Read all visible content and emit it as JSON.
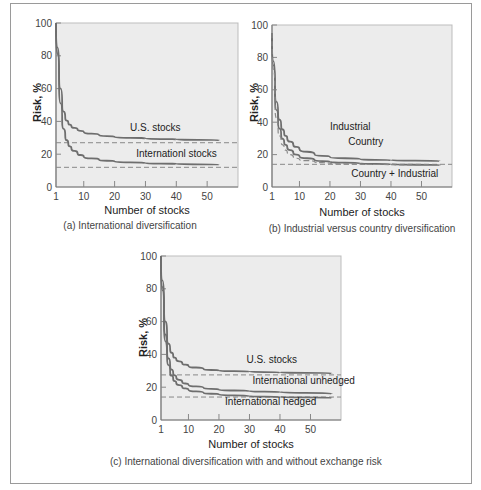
{
  "chart_data": [
    {
      "id": "a",
      "type": "line",
      "title": "(a) International diversification",
      "xlabel": "Number of stocks",
      "ylabel": "Risk, %",
      "xticks": [
        1,
        10,
        20,
        30,
        40,
        50
      ],
      "yticks": [
        0,
        20,
        40,
        60,
        80,
        100
      ],
      "xlim": [
        1,
        60
      ],
      "ylim": [
        0,
        100
      ],
      "series": [
        {
          "name": "U.S. stocks",
          "x": [
            1,
            2,
            3,
            4,
            5,
            6,
            8,
            10,
            15,
            20,
            30,
            40,
            54
          ],
          "y": [
            100,
            70,
            50,
            42,
            39,
            37,
            35,
            33.5,
            31.5,
            30.5,
            29.5,
            29,
            28.5
          ]
        },
        {
          "name": "Internationl stocks",
          "x": [
            1,
            2,
            3,
            4,
            5,
            6,
            8,
            10,
            15,
            20,
            30,
            40,
            54
          ],
          "y": [
            100,
            62,
            40,
            31,
            26,
            23.5,
            20.5,
            18.5,
            16.5,
            15.5,
            14.5,
            14,
            13.7
          ]
        }
      ],
      "reference_lines": [
        {
          "label": "U.S. stocks asymptote",
          "y": 27,
          "style": "dashed"
        },
        {
          "label": "International stocks asymptote",
          "y": 12,
          "style": "dashed"
        }
      ],
      "annotations": [
        {
          "text": "U.S. stocks",
          "x": 25,
          "y": 34
        },
        {
          "text": "Internationl stocks",
          "x": 27,
          "y": 18
        }
      ]
    },
    {
      "id": "b",
      "type": "line",
      "title": "(b) Industrial versus country diversification",
      "xlabel": "Number of stocks",
      "ylabel": "Risk, %",
      "xticks": [
        1,
        10,
        20,
        30,
        40,
        50
      ],
      "yticks": [
        0,
        20,
        40,
        60,
        80,
        100
      ],
      "xlim": [
        1,
        60
      ],
      "ylim": [
        0,
        100
      ],
      "series": [
        {
          "name": "Industrial",
          "x": [
            1,
            2,
            3,
            4,
            5,
            6,
            8,
            10,
            15,
            20,
            30,
            40,
            56
          ],
          "y": [
            95,
            60,
            45,
            38,
            33,
            30,
            26,
            23.5,
            20,
            18.5,
            17,
            16.5,
            16
          ]
        },
        {
          "name": "Country",
          "x": [
            1,
            2,
            3,
            4,
            5,
            6,
            8,
            10,
            15,
            20,
            30,
            40,
            56
          ],
          "y": [
            95,
            55,
            40,
            32,
            27.5,
            24.5,
            21,
            19,
            16.5,
            15.5,
            14.5,
            14,
            13.5
          ]
        },
        {
          "name": "Country + Industrial",
          "x": [
            1,
            2,
            3,
            4,
            5,
            6,
            8,
            10,
            15,
            20,
            30,
            40,
            56
          ],
          "y": [
            95,
            50,
            35,
            28,
            24,
            21.5,
            18.5,
            17,
            15.5,
            14.5,
            14,
            13.8,
            13.5
          ],
          "style": "dashed"
        }
      ],
      "reference_lines": [
        {
          "label": "asymptote",
          "y": 14,
          "style": "dashed"
        }
      ],
      "annotations": [
        {
          "text": "Industrial",
          "x": 20,
          "y": 35
        },
        {
          "text": "Country",
          "x": 26,
          "y": 26
        },
        {
          "text": "Country + Industrial",
          "x": 27,
          "y": 6
        }
      ]
    },
    {
      "id": "c",
      "type": "line",
      "title": "(c) International diversification with and without exchange risk",
      "xlabel": "Number of stocks",
      "ylabel": "Risk, %",
      "xticks": [
        1,
        10,
        20,
        30,
        40,
        50
      ],
      "yticks": [
        0,
        20,
        40,
        60,
        80,
        100
      ],
      "xlim": [
        1,
        60
      ],
      "ylim": [
        0,
        100
      ],
      "series": [
        {
          "name": "U.S. stocks",
          "x": [
            1,
            2,
            3,
            4,
            5,
            6,
            8,
            10,
            15,
            20,
            30,
            40,
            57
          ],
          "y": [
            100,
            70,
            50,
            43,
            39,
            37,
            34.5,
            33,
            31,
            30,
            29.5,
            29,
            28.5
          ]
        },
        {
          "name": "International unhedged",
          "x": [
            1,
            2,
            3,
            4,
            5,
            6,
            8,
            10,
            15,
            20,
            30,
            40,
            57
          ],
          "y": [
            100,
            62,
            42,
            33,
            28.5,
            26,
            23,
            21.5,
            19.5,
            18.5,
            17.5,
            17,
            16
          ]
        },
        {
          "name": "International hedged",
          "x": [
            1,
            2,
            3,
            4,
            5,
            6,
            8,
            10,
            15,
            20,
            30,
            40,
            57
          ],
          "y": [
            100,
            58,
            38,
            29,
            25,
            22.5,
            20,
            18.5,
            16.5,
            15.5,
            14.5,
            14,
            13.5
          ]
        }
      ],
      "reference_lines": [
        {
          "label": "U.S. asymptote",
          "y": 27.5,
          "style": "dashed"
        },
        {
          "label": "International asymptote",
          "y": 14,
          "style": "dashed"
        }
      ],
      "annotations": [
        {
          "text": "U.S. stocks",
          "x": 29,
          "y": 35
        },
        {
          "text": "International unhedged",
          "x": 31,
          "y": 22
        },
        {
          "text": "International hedged",
          "x": 22,
          "y": 9
        }
      ]
    }
  ]
}
